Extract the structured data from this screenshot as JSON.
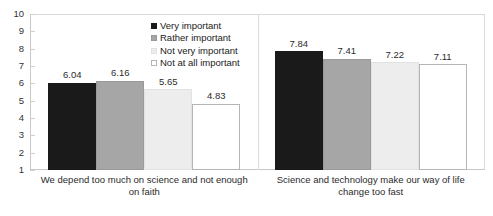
{
  "chart_data": {
    "type": "bar",
    "title": "",
    "xlabel": "",
    "ylabel": "",
    "ylim": [
      1,
      10
    ],
    "grid": false,
    "legend_position": "top-right-inside",
    "yticks": [
      "10",
      "9",
      "8",
      "7",
      "6",
      "5",
      "4",
      "3",
      "2",
      "1"
    ],
    "categories": [
      "We depend too much on science and not enough on faith",
      "Science and technology make our way of life change too fast"
    ],
    "series": [
      {
        "name": "Very important",
        "color": "#1a1a1a",
        "border": "#1a1a1a",
        "values": [
          6.04,
          7.84
        ],
        "labels": [
          "6.04",
          "7.84"
        ]
      },
      {
        "name": "Rather important",
        "color": "#a6a6a6",
        "border": "#9a9a9a",
        "values": [
          6.16,
          7.41
        ],
        "labels": [
          "6.16",
          "7.41"
        ]
      },
      {
        "name": "Not very important",
        "color": "#ededed",
        "border": "#e2e2e2",
        "values": [
          5.65,
          7.22
        ],
        "labels": [
          "5.65",
          "7.22"
        ]
      },
      {
        "name": "Not at all important",
        "color": "#ffffff",
        "border": "#b5b5b5",
        "values": [
          4.83,
          7.11
        ],
        "labels": [
          "4.83",
          "7.11"
        ]
      }
    ]
  }
}
